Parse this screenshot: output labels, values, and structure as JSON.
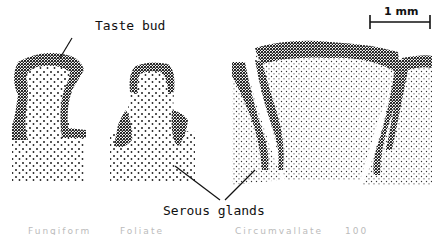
{
  "figure": {
    "labels": {
      "taste_bud": "Taste bud",
      "serous_glands": "Serous glands",
      "scale_bar": "1 mm"
    },
    "panels": [
      {
        "name": "fungiform-papilla"
      },
      {
        "name": "foliate-papilla"
      },
      {
        "name": "circumvallate-papilla"
      }
    ],
    "colors": {
      "ink": "#111111",
      "background": "#ffffff"
    },
    "bottom_cut_text": [
      "Fungiform",
      "Foliate",
      "Circumvallate",
      "100"
    ]
  }
}
